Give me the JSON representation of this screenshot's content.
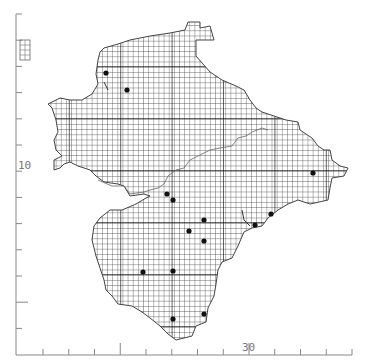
{
  "map": {
    "type": "grid-square distribution map",
    "axes": {
      "x_label_major": "30",
      "y_label_major": "10",
      "x_ticks_count": 13,
      "y_ticks_count": 13
    },
    "colors": {
      "grid": "#2a2a2a",
      "outline": "#555555",
      "dot": "#111111",
      "axis": "#888888",
      "label": "#777777"
    },
    "records": [
      {
        "x": 106,
        "y": 73
      },
      {
        "x": 127,
        "y": 90
      },
      {
        "x": 313,
        "y": 173
      },
      {
        "x": 167,
        "y": 194
      },
      {
        "x": 173,
        "y": 200
      },
      {
        "x": 204,
        "y": 220
      },
      {
        "x": 189,
        "y": 231
      },
      {
        "x": 204,
        "y": 241
      },
      {
        "x": 271,
        "y": 214
      },
      {
        "x": 255,
        "y": 225
      },
      {
        "x": 143,
        "y": 272
      },
      {
        "x": 173,
        "y": 271
      },
      {
        "x": 173,
        "y": 319
      },
      {
        "x": 204,
        "y": 314
      }
    ],
    "record_count": "14"
  }
}
